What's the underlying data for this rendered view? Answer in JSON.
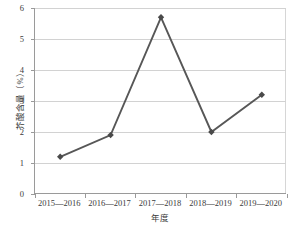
{
  "chart_data": {
    "type": "line",
    "title": "",
    "subtitle": "",
    "xlabel": "年度",
    "ylabel": "芥酸含量（%）",
    "categories": [
      "2015—2016",
      "2016—2017",
      "2017—2018",
      "2018—2019",
      "2019—2020"
    ],
    "values": [
      1.2,
      1.9,
      5.7,
      2.0,
      3.2
    ],
    "series": [
      {
        "name": "芥酸含量",
        "values": [
          1.2,
          1.9,
          5.7,
          2.0,
          3.2
        ]
      }
    ],
    "ylim": [
      0,
      6
    ],
    "yticks": [
      "0",
      "1",
      "2",
      "3",
      "4",
      "5",
      "6"
    ],
    "ytick_values": [
      0,
      1,
      2,
      3,
      4,
      5,
      6
    ],
    "grid": "horizontal",
    "legend": "none",
    "marker": "diamond",
    "line_color": "#575757",
    "marker_color": "#4a4a4a",
    "gridline_color": "#d2d2d2",
    "axis_color": "#9a9a9a",
    "text_color": "#3b3b3b",
    "background": "#ffffff"
  },
  "figure": {
    "caption_fragment": ""
  }
}
